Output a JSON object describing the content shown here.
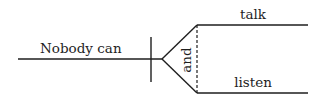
{
  "diagram": {
    "type": "sentence-diagram",
    "sentence": "Nobody can talk and listen",
    "subject": {
      "label": "Nobody can"
    },
    "conjunction": {
      "label": "and"
    },
    "predicates": [
      {
        "label": "talk"
      },
      {
        "label": "listen"
      }
    ],
    "colors": {
      "line": "#1e1e1e",
      "text": "#1e1e1e",
      "background": "#ffffff"
    }
  }
}
